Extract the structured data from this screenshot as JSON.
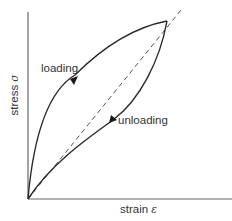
{
  "diagram": {
    "type": "stress-strain hysteresis loop",
    "axes": {
      "y_label": "stress",
      "y_symbol": "σ",
      "x_label": "strain",
      "x_symbol": "ε"
    },
    "curves": [
      {
        "name": "loading",
        "label": "loading",
        "style": "solid",
        "direction": "up"
      },
      {
        "name": "unloading",
        "label": "unloading",
        "style": "solid",
        "direction": "down"
      },
      {
        "name": "linear-elastic-reference",
        "label": "",
        "style": "dashed"
      }
    ],
    "colors": {
      "line": "#2a2a2a",
      "axis": "#555555",
      "text": "#333333",
      "background": "#ffffff"
    }
  }
}
